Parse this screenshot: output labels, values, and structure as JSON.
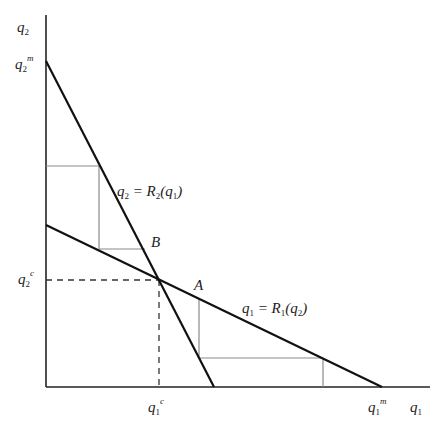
{
  "diagram": {
    "type": "cournot-reaction-functions",
    "axes": {
      "x_label": {
        "base": "q",
        "sub": "1"
      },
      "y_label": {
        "base": "q",
        "sub": "2"
      }
    },
    "ticks": {
      "q2m": {
        "base": "q",
        "sub": "2",
        "sup": "m"
      },
      "q2c": {
        "base": "q",
        "sub": "2",
        "sup": "c"
      },
      "q1c": {
        "base": "q",
        "sub": "1",
        "sup": "c"
      },
      "q1m": {
        "base": "q",
        "sub": "1",
        "sup": "m"
      }
    },
    "curves": {
      "r2": {
        "label_lhs": "q",
        "lhs_sub": "2",
        "label_mid": " = R",
        "mid_sub": "2",
        "arg_open": "(q",
        "arg_sub": "1",
        "arg_close": ")"
      },
      "r1": {
        "label_lhs": "q",
        "lhs_sub": "1",
        "label_mid": " = R",
        "mid_sub": "1",
        "arg_open": "(q",
        "arg_sub": "2",
        "arg_close": ")"
      }
    },
    "points": {
      "A": "A",
      "B": "B"
    },
    "colors": {
      "axis": "#222222",
      "curve": "#111111",
      "adjustment_path": "#8a8a8a",
      "dashed": "#333333"
    }
  }
}
